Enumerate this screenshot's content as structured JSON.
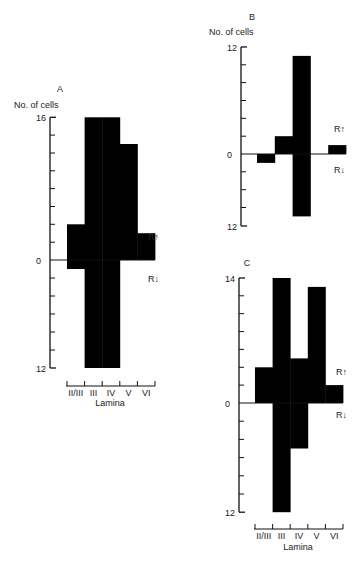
{
  "figure": {
    "background": "#ffffff",
    "bar_color": "#000000",
    "axis_color": "#111111"
  },
  "chart_data": [
    {
      "panel": "A",
      "type": "bar",
      "title": "A",
      "ylabel": "No. of cells",
      "xlabel": "Lamina",
      "categories": [
        "II/III",
        "III",
        "IV",
        "V",
        "VI"
      ],
      "series": [
        {
          "name": "R↑",
          "values": [
            4,
            16,
            16,
            13,
            3
          ]
        },
        {
          "name": "R↓",
          "values": [
            1,
            12,
            12,
            0,
            0
          ]
        }
      ],
      "ylim_up": 16,
      "ylim_down": 12,
      "ytick_step": 2,
      "ytick_labels": {
        "top": "16",
        "zero": "0",
        "bottom": "12"
      },
      "legend": {
        "up": "R↑",
        "down": "R↓"
      },
      "grid": false,
      "show_xaxis": true,
      "layout": {
        "axis_x": 50,
        "zero_y": 260,
        "px_per_unit_up": 8.92,
        "px_per_unit_down": 9.0,
        "bin_start": 67,
        "bin_width": 17.6,
        "xaxis_y": 386,
        "letter": [
          60,
          92
        ],
        "ylabel_pos": [
          14,
          108
        ],
        "legend_up": [
          148,
          240
        ],
        "legend_down": [
          148,
          282
        ],
        "lamina_pos": [
          110,
          406
        ]
      }
    },
    {
      "panel": "B",
      "type": "bar",
      "title": "B",
      "ylabel": "No. of cells",
      "xlabel": "",
      "categories": [
        "II/III",
        "III",
        "IV",
        "V",
        "VI"
      ],
      "series": [
        {
          "name": "R↑",
          "values": [
            0,
            2,
            11,
            0,
            1
          ]
        },
        {
          "name": "R↓",
          "values": [
            1,
            0,
            7,
            0,
            0
          ]
        }
      ],
      "ylim_up": 12,
      "ylim_down": 12,
      "ytick_step": 2,
      "ytick_labels": {
        "top": "12",
        "zero": "0",
        "bottom": "12"
      },
      "legend": {
        "up": "R↑",
        "down": "R↓"
      },
      "grid": false,
      "show_xaxis": false,
      "layout": {
        "axis_x": 241,
        "zero_y": 154,
        "px_per_unit_up": 8.92,
        "px_per_unit_down": 8.92,
        "bottom_y": 226,
        "bin_start": 257,
        "bin_width": 17.8,
        "letter": [
          252,
          20
        ],
        "ylabel_pos": [
          209,
          35
        ],
        "legend_up": [
          334,
          132
        ],
        "legend_down": [
          334,
          173
        ]
      }
    },
    {
      "panel": "C",
      "type": "bar",
      "title": "C",
      "ylabel": "",
      "xlabel": "Lamina",
      "categories": [
        "II/III",
        "III",
        "IV",
        "V",
        "VI"
      ],
      "series": [
        {
          "name": "R↑",
          "values": [
            4,
            14,
            5,
            13,
            2
          ]
        },
        {
          "name": "R↓",
          "values": [
            0,
            12,
            5,
            0,
            0
          ]
        }
      ],
      "ylim_up": 14,
      "ylim_down": 12,
      "ytick_step": 2,
      "ytick_labels": {
        "top": "14",
        "zero": "0",
        "bottom": "12"
      },
      "legend": {
        "up": "R↑",
        "down": "R↓"
      },
      "grid": false,
      "show_xaxis": true,
      "layout": {
        "axis_x": 239,
        "zero_y": 403,
        "px_per_unit_up": 8.93,
        "px_per_unit_down": 9.1,
        "bin_start": 255,
        "bin_width": 17.6,
        "xaxis_y": 529,
        "letter": [
          247,
          266
        ],
        "ylabel_pos": null,
        "legend_up": [
          336,
          375
        ],
        "legend_down": [
          336,
          418
        ],
        "lamina_pos": [
          298,
          550
        ]
      }
    }
  ]
}
